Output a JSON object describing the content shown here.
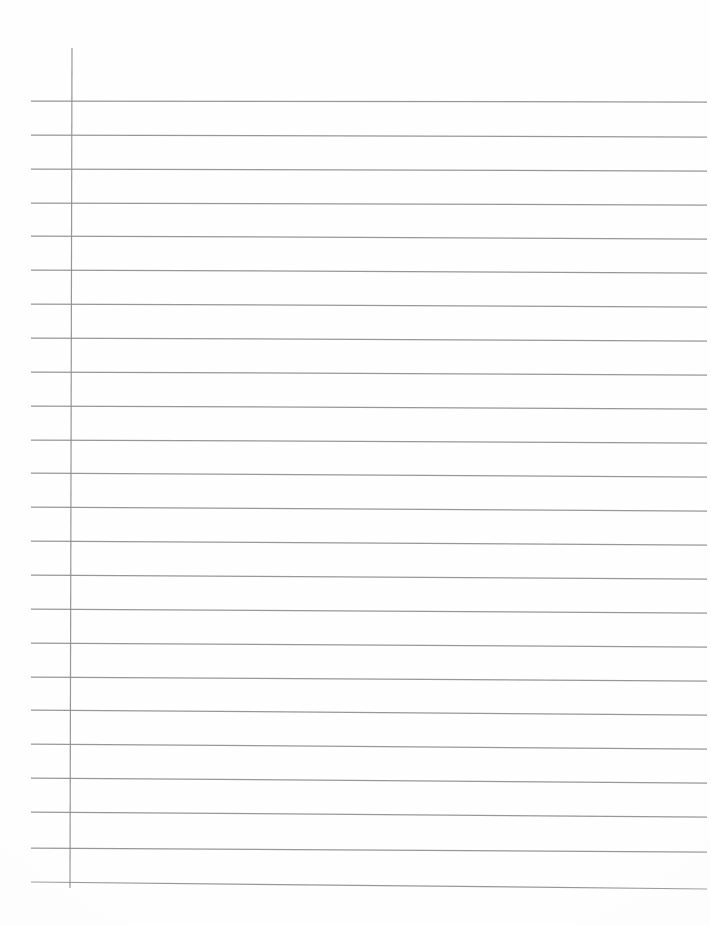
{
  "document": {
    "kind": "lined-notebook-page-scan",
    "title": "Blank ruled notebook page",
    "page_width": 710,
    "page_height": 925,
    "background_color": "#ffffff",
    "paper_color": "#fefefe",
    "written_content": "",
    "handwriting_present": "none",
    "visible_text": ""
  },
  "ruling": {
    "style": "wide-ruled",
    "line_color": "#8d8f91",
    "margin_color": "#8a8c8e",
    "line_count": 24,
    "line_spacing_px": 34,
    "first_line_y": 101,
    "last_line_y": 886,
    "line_left_x": 31,
    "line_right_x": 707,
    "slope_px_across_page": 5,
    "margin_line_x_top": 72,
    "margin_line_x_bottom": 70,
    "margin_line_y_start": 48,
    "margin_line_y_end": 888
  },
  "horizontal_lines": [
    {
      "index": 1,
      "y_left": 101,
      "y_right": 102
    },
    {
      "index": 2,
      "y_left": 135,
      "y_right": 137
    },
    {
      "index": 3,
      "y_left": 169,
      "y_right": 171
    },
    {
      "index": 4,
      "y_left": 203,
      "y_right": 205
    },
    {
      "index": 5,
      "y_left": 236,
      "y_right": 239
    },
    {
      "index": 6,
      "y_left": 270,
      "y_right": 273
    },
    {
      "index": 7,
      "y_left": 304,
      "y_right": 307
    },
    {
      "index": 8,
      "y_left": 338,
      "y_right": 341
    },
    {
      "index": 9,
      "y_left": 372,
      "y_right": 375
    },
    {
      "index": 10,
      "y_left": 406,
      "y_right": 409
    },
    {
      "index": 11,
      "y_left": 440,
      "y_right": 443
    },
    {
      "index": 12,
      "y_left": 473,
      "y_right": 477
    },
    {
      "index": 13,
      "y_left": 507,
      "y_right": 511
    },
    {
      "index": 14,
      "y_left": 541,
      "y_right": 545
    },
    {
      "index": 15,
      "y_left": 575,
      "y_right": 579
    },
    {
      "index": 16,
      "y_left": 609,
      "y_right": 613
    },
    {
      "index": 17,
      "y_left": 643,
      "y_right": 647
    },
    {
      "index": 18,
      "y_left": 677,
      "y_right": 681
    },
    {
      "index": 19,
      "y_left": 710,
      "y_right": 715
    },
    {
      "index": 20,
      "y_left": 744,
      "y_right": 749
    },
    {
      "index": 21,
      "y_left": 778,
      "y_right": 783
    },
    {
      "index": 22,
      "y_left": 812,
      "y_right": 817
    },
    {
      "index": 23,
      "y_left": 848,
      "y_right": 852
    },
    {
      "index": 24,
      "y_left": 882,
      "y_right": 889
    }
  ]
}
